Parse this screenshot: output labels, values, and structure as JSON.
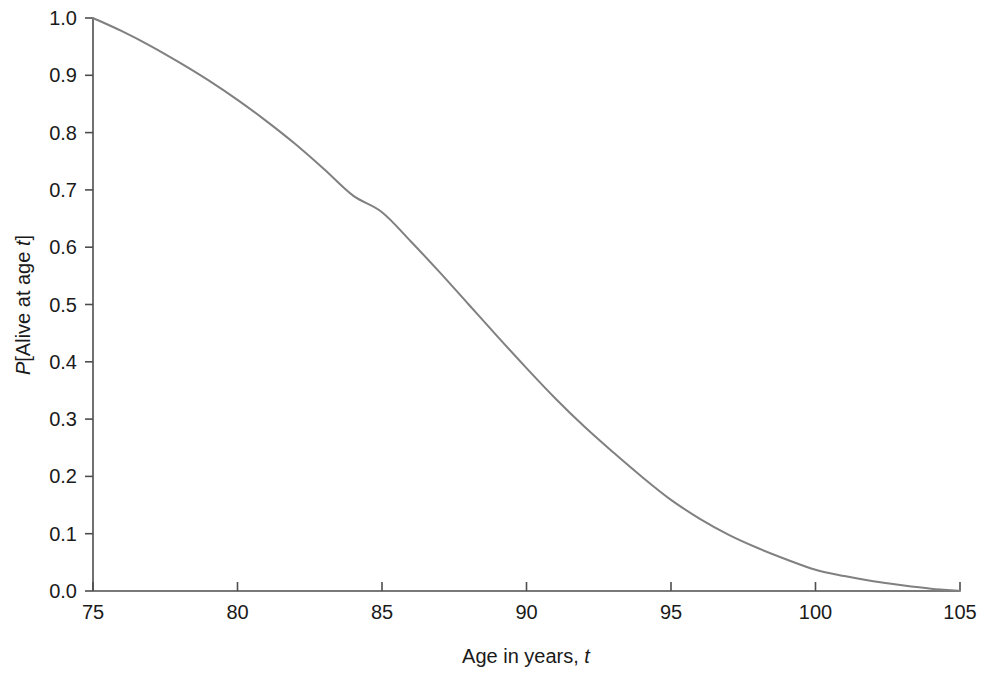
{
  "chart_data": {
    "type": "line",
    "title": "",
    "subtitle": "",
    "xlabel": "Age in years, t",
    "xlabel_parts": {
      "plain": "Age in years, ",
      "italic": "t"
    },
    "ylabel": "P[Alive at age t]",
    "ylabel_parts": {
      "italic_lead": "P",
      "plain": "[Alive at age ",
      "italic_tail": "t",
      "plain_tail": "]"
    },
    "xlim": [
      75,
      105
    ],
    "ylim": [
      0.0,
      1.0
    ],
    "xticks": [
      75,
      80,
      85,
      90,
      95,
      100,
      105
    ],
    "xtick_labels": [
      "75",
      "80",
      "85",
      "90",
      "95",
      "100",
      "105"
    ],
    "yticks": [
      0.0,
      0.1,
      0.2,
      0.3,
      0.4,
      0.5,
      0.6,
      0.7,
      0.8,
      0.9,
      1.0
    ],
    "ytick_labels": [
      "0.0",
      "0.1",
      "0.2",
      "0.3",
      "0.4",
      "0.5",
      "0.6",
      "0.7",
      "0.8",
      "0.9",
      "1.0"
    ],
    "grid": false,
    "legend": "none",
    "series": [
      {
        "name": "Survival probability",
        "color": "#808080",
        "line_width": 2,
        "x": [
          75,
          76,
          77,
          78,
          79,
          80,
          81,
          82,
          83,
          84,
          85,
          86,
          87,
          88,
          89,
          90,
          91,
          92,
          93,
          94,
          95,
          96,
          97,
          98,
          99,
          100,
          101,
          102,
          103,
          104,
          105
        ],
        "values": [
          1.0,
          0.977,
          0.951,
          0.922,
          0.891,
          0.857,
          0.82,
          0.78,
          0.736,
          0.69,
          0.661,
          0.61,
          0.556,
          0.5,
          0.444,
          0.389,
          0.336,
          0.287,
          0.242,
          0.199,
          0.159,
          0.126,
          0.098,
          0.075,
          0.055,
          0.037,
          0.026,
          0.017,
          0.01,
          0.004,
          0.0
        ]
      }
    ],
    "annotations": []
  },
  "axes": {
    "x_axis_name": "x-axis",
    "y_axis_name": "y-axis",
    "tick_direction": "inward"
  },
  "colors": {
    "background": "#ffffff",
    "axis": "#4d4d4d",
    "text": "#1a1a1a",
    "curve": "#808080"
  }
}
